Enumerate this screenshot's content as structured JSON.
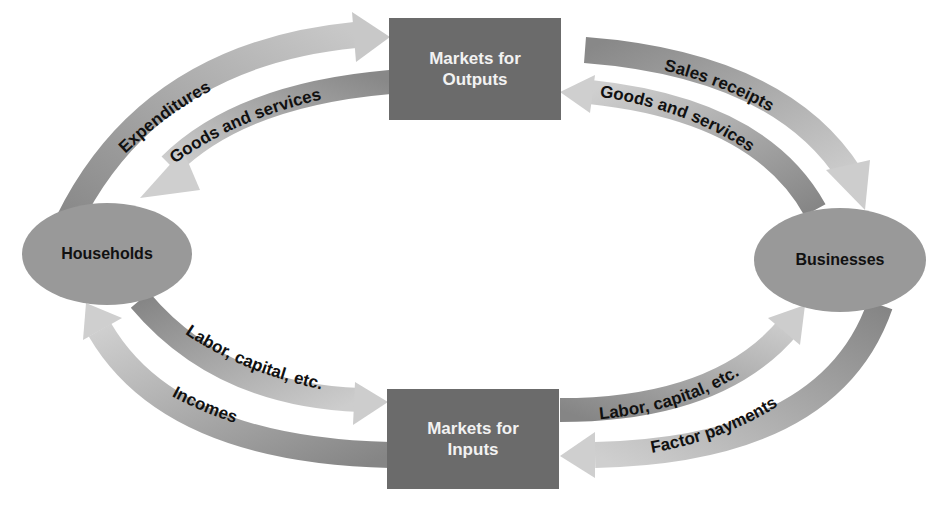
{
  "diagram": {
    "type": "circular-flow",
    "nodes": {
      "markets_outputs": {
        "line1": "Markets for",
        "line2": "Outputs"
      },
      "markets_inputs": {
        "line1": "Markets for",
        "line2": "Inputs"
      },
      "households": {
        "label": "Households"
      },
      "businesses": {
        "label": "Businesses"
      }
    },
    "flows": {
      "expenditures": "Expenditures",
      "goods_services_left": "Goods and services",
      "sales_receipts": "Sales receipts",
      "goods_services_right": "Goods and services",
      "labor_capital_left": "Labor, capital, etc.",
      "incomes": "Incomes",
      "labor_capital_right": "Labor, capital, etc.",
      "factor_payments": "Factor payments"
    },
    "colors": {
      "dark_arrow": "#8a8a8a",
      "light_arrow": "#c4c4c4",
      "box": "#6b6b6b",
      "ellipse": "#999999"
    }
  }
}
